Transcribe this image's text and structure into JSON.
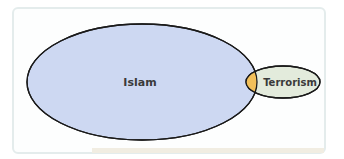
{
  "diagram": {
    "type": "venn",
    "sets": [
      {
        "label": "Islam",
        "fill": "#cdd8f2",
        "stroke": "#1a1a1a"
      },
      {
        "label": "Terrorism",
        "fill": "#e3ebdc",
        "stroke": "#1a1a1a"
      }
    ],
    "intersection": {
      "fill": "#f2c05a"
    }
  }
}
